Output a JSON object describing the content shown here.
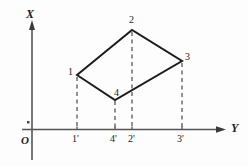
{
  "figure": {
    "background_color": "#fdfdfd",
    "stroke_color": "#1c1c1c",
    "axis_color": "#555555",
    "dash_color": "#4a4a4a",
    "axes": {
      "x_axis_label": "X",
      "y_axis_label": "Y",
      "origin_label": "O"
    },
    "vertices": [
      {
        "name": "1",
        "label": "1",
        "x": 77,
        "y": 75
      },
      {
        "name": "2",
        "label": "2",
        "x": 132,
        "y": 30
      },
      {
        "name": "3",
        "label": "3",
        "x": 182,
        "y": 61
      },
      {
        "name": "4",
        "label": "4",
        "x": 115,
        "y": 100
      }
    ],
    "projections": [
      {
        "name": "1p",
        "label": "1'",
        "x": 77,
        "axis_y": 130
      },
      {
        "name": "4p",
        "label": "4'",
        "x": 115,
        "axis_y": 130
      },
      {
        "name": "2p",
        "label": "2'",
        "x": 132,
        "axis_y": 130
      },
      {
        "name": "3p",
        "label": "3'",
        "x": 182,
        "axis_y": 130
      }
    ],
    "labels": {
      "x_axis": "X",
      "y_axis": "Y",
      "origin": "O",
      "v1": "1",
      "v2": "2",
      "v3": "3",
      "v4": "4",
      "p1": "1'",
      "p4": "4'",
      "p2": "2'",
      "p3": "3'"
    }
  }
}
